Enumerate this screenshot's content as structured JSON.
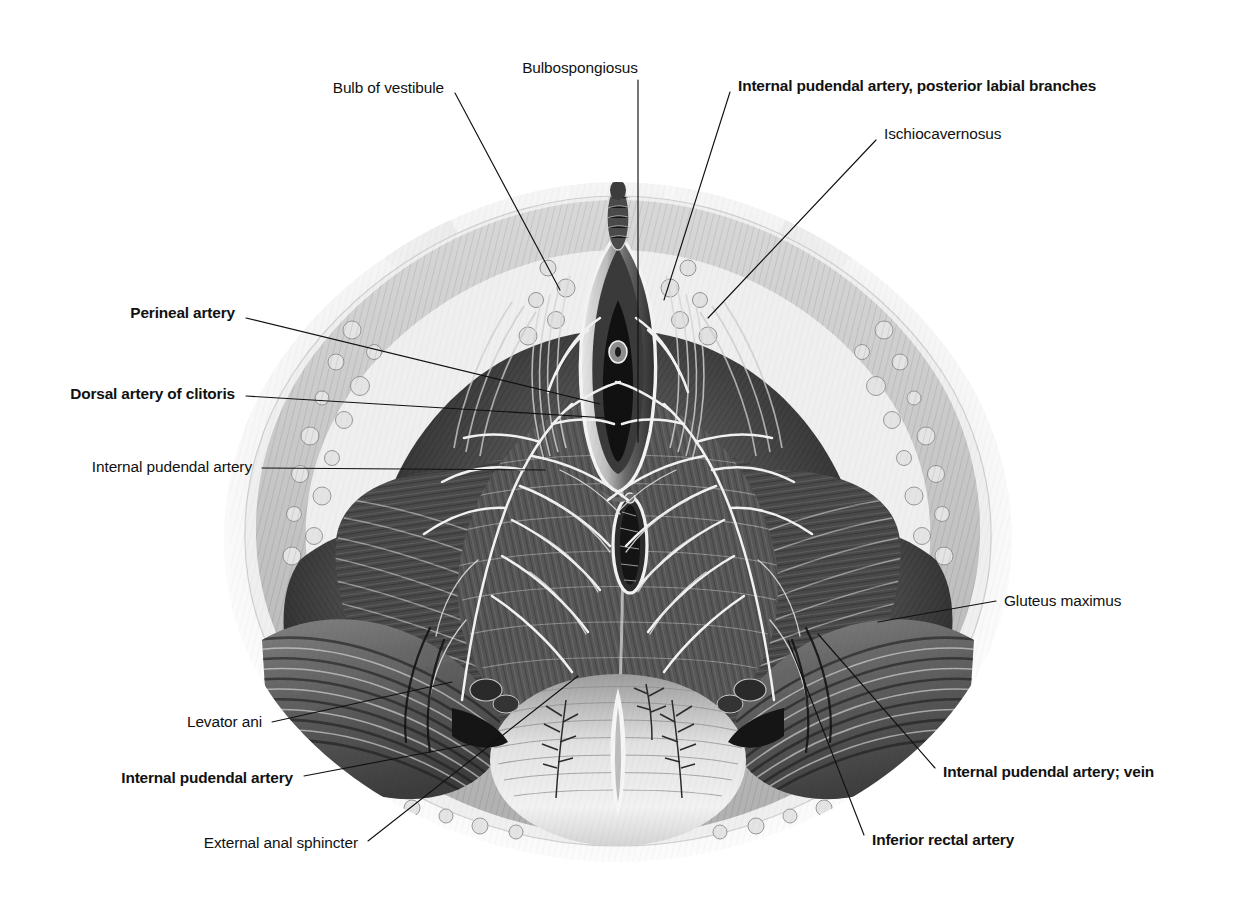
{
  "figure": {
    "view": "lithotomy position, superficial and deep dissection",
    "style": "grayscale anatomical engraving",
    "background_color": "#ffffff",
    "ink_color": "#111111"
  },
  "labels": [
    {
      "id": "bulb-of-vestibule",
      "text": "Bulb of vestibule",
      "bold": false,
      "align": "r",
      "text_x": 444,
      "text_y": 88,
      "leader": [
        [
          455,
          93
        ],
        [
          560,
          290
        ]
      ]
    },
    {
      "id": "bulbospongiosus",
      "text": "Bulbospongiosus",
      "bold": false,
      "align": "c",
      "text_x": 580,
      "text_y": 68,
      "leader": [
        [
          638,
          80
        ],
        [
          638,
          442
        ]
      ]
    },
    {
      "id": "internal-pudendal-artery-posterior-labial-branches",
      "text": "Internal pudendal artery, posterior labial branches",
      "bold": true,
      "align": "l",
      "text_x": 738,
      "text_y": 86,
      "leader": [
        [
          730,
          92
        ],
        [
          664,
          300
        ]
      ]
    },
    {
      "id": "ischiocavernosus",
      "text": "Ischiocavernosus",
      "bold": false,
      "align": "l",
      "text_x": 884,
      "text_y": 134,
      "leader": [
        [
          876,
          140
        ],
        [
          708,
          318
        ]
      ]
    },
    {
      "id": "perineal-artery",
      "text": "Perineal artery",
      "bold": true,
      "align": "r",
      "text_x": 235,
      "text_y": 313,
      "leader": [
        [
          246,
          318
        ],
        [
          600,
          404
        ]
      ]
    },
    {
      "id": "dorsal-artery-of-clitoris",
      "text": "Dorsal artery of clitoris",
      "bold": true,
      "align": "r",
      "text_x": 235,
      "text_y": 394,
      "leader": [
        [
          246,
          396
        ],
        [
          608,
          418
        ]
      ]
    },
    {
      "id": "internal-pudendal-artery-left",
      "text": "Internal pudendal artery",
      "bold": false,
      "align": "r",
      "text_x": 252,
      "text_y": 467,
      "leader": [
        [
          262,
          468
        ],
        [
          545,
          470
        ]
      ]
    },
    {
      "id": "gluteus-maximus",
      "text": "Gluteus maximus",
      "bold": false,
      "align": "l",
      "text_x": 1004,
      "text_y": 601,
      "leader": [
        [
          996,
          601
        ],
        [
          878,
          622
        ]
      ]
    },
    {
      "id": "levator-ani",
      "text": "Levator ani",
      "bold": false,
      "align": "r",
      "text_x": 262,
      "text_y": 722,
      "leader": [
        [
          272,
          722
        ],
        [
          452,
          682
        ]
      ]
    },
    {
      "id": "internal-pudendal-artery-bottom",
      "text": "Internal pudendal artery",
      "bold": true,
      "align": "r",
      "text_x": 293,
      "text_y": 778,
      "leader": [
        [
          304,
          776
        ],
        [
          472,
          744
        ]
      ]
    },
    {
      "id": "external-anal-sphincter",
      "text": "External anal sphincter",
      "bold": false,
      "align": "r",
      "text_x": 358,
      "text_y": 843,
      "leader": [
        [
          368,
          841
        ],
        [
          578,
          676
        ]
      ]
    },
    {
      "id": "internal-pudendal-artery-vein",
      "text": "Internal pudendal artery; vein",
      "bold": true,
      "align": "l",
      "text_x": 943,
      "text_y": 772,
      "leader": [
        [
          935,
          768
        ],
        [
          818,
          634
        ]
      ]
    },
    {
      "id": "inferior-rectal-artery",
      "text": "Inferior rectal artery",
      "bold": true,
      "align": "l",
      "text_x": 872,
      "text_y": 840,
      "leader": [
        [
          864,
          835
        ],
        [
          788,
          640
        ]
      ]
    }
  ]
}
